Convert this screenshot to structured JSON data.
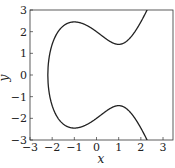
{
  "chart_data": {
    "type": "line",
    "title": "",
    "xlabel": "x",
    "ylabel": "y",
    "xlim": [
      -3,
      3.45
    ],
    "ylim": [
      -3,
      3
    ],
    "xticks": [
      "−3",
      "−2",
      "−1",
      "0",
      "1",
      "2",
      "3"
    ],
    "yticks": [
      "3",
      "2",
      "1",
      "0",
      "−1",
      "−2",
      "−3"
    ],
    "grid": false,
    "legend": null,
    "series": [
      {
        "name": "curve (y² = x³ − 3x + 4)",
        "x": [
          -2.196,
          -2.1,
          -2.0,
          -1.8,
          -1.5,
          -1.2,
          -1.0,
          -0.5,
          0.0,
          0.5,
          1.0,
          1.5,
          2.0,
          2.28
        ],
        "y_upper": [
          0.0,
          0.94,
          1.41,
          1.9,
          2.29,
          2.43,
          2.45,
          2.29,
          2.0,
          1.68,
          1.41,
          1.58,
          2.45,
          3.0
        ],
        "y_lower": [
          0.0,
          -0.94,
          -1.41,
          -1.9,
          -2.29,
          -2.43,
          -2.45,
          -2.29,
          -2.0,
          -1.68,
          -1.41,
          -1.58,
          -2.45,
          -3.0
        ]
      }
    ],
    "color": "#222222"
  }
}
